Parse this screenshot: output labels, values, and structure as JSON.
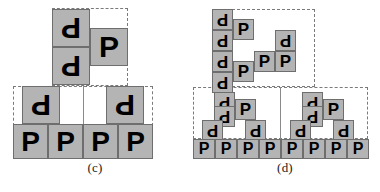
{
  "figure": {
    "background_color": "#ffffff",
    "block_fill": "#b4b4b4",
    "block_border": "#6e6e6e",
    "glyph_color": "#000000",
    "dash_color": "#7a7a7a"
  },
  "glyphs": {
    "upright": "P",
    "rotated": "P"
  },
  "panels": [
    {
      "id": "c",
      "caption": "(c)",
      "regions": [
        {
          "name": "upper-dashed-region",
          "x": 52,
          "y": 8,
          "w": 76,
          "h": 78
        },
        {
          "name": "lower-dashed-region",
          "x": 13,
          "y": 86,
          "w": 140,
          "h": 40
        }
      ],
      "dividers": [
        {
          "name": "lower-region-divider",
          "x": 83,
          "y": 86,
          "h": 40
        }
      ],
      "blocks": [
        {
          "name": "block-rotated-p",
          "glyph": "P",
          "rot": 180,
          "x": 52,
          "y": 9,
          "w": 38,
          "h": 38
        },
        {
          "name": "block-rotated-p",
          "glyph": "P",
          "rot": 180,
          "x": 52,
          "y": 47,
          "w": 38,
          "h": 38
        },
        {
          "name": "block-upright-p",
          "glyph": "P",
          "rot": 0,
          "x": 90,
          "y": 28,
          "w": 38,
          "h": 38
        },
        {
          "name": "block-rotated-p",
          "glyph": "P",
          "rot": 180,
          "x": 22,
          "y": 86,
          "w": 38,
          "h": 38
        },
        {
          "name": "block-rotated-p",
          "glyph": "P",
          "rot": 180,
          "x": 106,
          "y": 86,
          "w": 38,
          "h": 38
        },
        {
          "name": "block-upright-p",
          "glyph": "P",
          "rot": 0,
          "x": 13,
          "y": 124,
          "w": 35,
          "h": 35
        },
        {
          "name": "block-upright-p",
          "glyph": "P",
          "rot": 0,
          "x": 48,
          "y": 124,
          "w": 35,
          "h": 35
        },
        {
          "name": "block-upright-p",
          "glyph": "P",
          "rot": 0,
          "x": 83,
          "y": 124,
          "w": 35,
          "h": 35
        },
        {
          "name": "block-upright-p",
          "glyph": "P",
          "rot": 0,
          "x": 118,
          "y": 124,
          "w": 35,
          "h": 35
        }
      ]
    },
    {
      "id": "d",
      "caption": "(d)",
      "regions": [
        {
          "name": "upper-dashed-region",
          "x": 22,
          "y": 9,
          "w": 103,
          "h": 78
        },
        {
          "name": "lower-dashed-region",
          "x": 3,
          "y": 87,
          "w": 175,
          "h": 52
        }
      ],
      "dividers": [
        {
          "name": "lower-region-divider",
          "x": 90,
          "y": 87,
          "h": 52
        }
      ],
      "blocks": [
        {
          "name": "block-rotated-p",
          "glyph": "P",
          "rot": 180,
          "x": 22,
          "y": 9,
          "w": 21,
          "h": 21
        },
        {
          "name": "block-rotated-p",
          "glyph": "P",
          "rot": 180,
          "x": 22,
          "y": 30,
          "w": 21,
          "h": 21
        },
        {
          "name": "block-rotated-p",
          "glyph": "P",
          "rot": 180,
          "x": 22,
          "y": 51,
          "w": 21,
          "h": 21
        },
        {
          "name": "block-rotated-p",
          "glyph": "P",
          "rot": 180,
          "x": 22,
          "y": 72,
          "w": 21,
          "h": 21
        },
        {
          "name": "block-upright-p",
          "glyph": "P",
          "rot": 0,
          "x": 43,
          "y": 19,
          "w": 21,
          "h": 21
        },
        {
          "name": "block-upright-p",
          "glyph": "P",
          "rot": 0,
          "x": 43,
          "y": 61,
          "w": 21,
          "h": 21
        },
        {
          "name": "block-rotated-p",
          "glyph": "P",
          "rot": 180,
          "x": 85,
          "y": 30,
          "w": 21,
          "h": 21
        },
        {
          "name": "block-upright-p",
          "glyph": "P",
          "rot": 0,
          "x": 64,
          "y": 51,
          "w": 21,
          "h": 21
        },
        {
          "name": "block-upright-p",
          "glyph": "P",
          "rot": 0,
          "x": 85,
          "y": 51,
          "w": 21,
          "h": 21
        },
        {
          "name": "block-rotated-p",
          "glyph": "P",
          "rot": 180,
          "x": 24,
          "y": 92,
          "w": 21,
          "h": 21
        },
        {
          "name": "block-rotated-p",
          "glyph": "P",
          "rot": 180,
          "x": 24,
          "y": 106,
          "w": 21,
          "h": 21
        },
        {
          "name": "block-upright-p",
          "glyph": "P",
          "rot": 0,
          "x": 45,
          "y": 99,
          "w": 21,
          "h": 21
        },
        {
          "name": "block-rotated-p",
          "glyph": "P",
          "rot": 180,
          "x": 12,
          "y": 120,
          "w": 21,
          "h": 21
        },
        {
          "name": "block-rotated-p",
          "glyph": "P",
          "rot": 180,
          "x": 55,
          "y": 120,
          "w": 21,
          "h": 21
        },
        {
          "name": "block-rotated-p",
          "glyph": "P",
          "rot": 180,
          "x": 112,
          "y": 92,
          "w": 21,
          "h": 21
        },
        {
          "name": "block-rotated-p",
          "glyph": "P",
          "rot": 180,
          "x": 112,
          "y": 106,
          "w": 21,
          "h": 21
        },
        {
          "name": "block-upright-p",
          "glyph": "P",
          "rot": 0,
          "x": 133,
          "y": 99,
          "w": 21,
          "h": 21
        },
        {
          "name": "block-rotated-p",
          "glyph": "P",
          "rot": 180,
          "x": 100,
          "y": 120,
          "w": 21,
          "h": 21
        },
        {
          "name": "block-rotated-p",
          "glyph": "P",
          "rot": 180,
          "x": 143,
          "y": 120,
          "w": 21,
          "h": 21
        },
        {
          "name": "block-upright-p",
          "glyph": "P",
          "rot": 0,
          "x": 3,
          "y": 139,
          "w": 22,
          "h": 20
        },
        {
          "name": "block-upright-p",
          "glyph": "P",
          "rot": 0,
          "x": 25,
          "y": 139,
          "w": 22,
          "h": 20
        },
        {
          "name": "block-upright-p",
          "glyph": "P",
          "rot": 0,
          "x": 47,
          "y": 139,
          "w": 22,
          "h": 20
        },
        {
          "name": "block-upright-p",
          "glyph": "P",
          "rot": 0,
          "x": 69,
          "y": 139,
          "w": 22,
          "h": 20
        },
        {
          "name": "block-upright-p",
          "glyph": "P",
          "rot": 0,
          "x": 91,
          "y": 139,
          "w": 22,
          "h": 20
        },
        {
          "name": "block-upright-p",
          "glyph": "P",
          "rot": 0,
          "x": 113,
          "y": 139,
          "w": 22,
          "h": 20
        },
        {
          "name": "block-upright-p",
          "glyph": "P",
          "rot": 0,
          "x": 135,
          "y": 139,
          "w": 22,
          "h": 20
        },
        {
          "name": "block-upright-p",
          "glyph": "P",
          "rot": 0,
          "x": 157,
          "y": 139,
          "w": 22,
          "h": 20
        }
      ]
    }
  ]
}
